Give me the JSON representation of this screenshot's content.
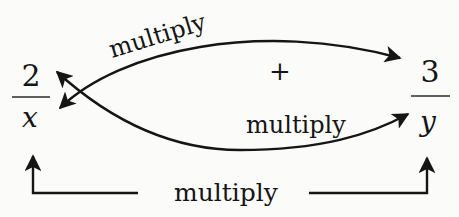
{
  "diagram": {
    "left_fraction": {
      "numerator": "2",
      "denominator": "x"
    },
    "right_fraction": {
      "numerator": "3",
      "denominator": "y"
    },
    "operator": "+",
    "labels": {
      "top_curve": "multiply",
      "lower_curve": "multiply",
      "bottom_connector": "multiply"
    },
    "colors": {
      "ink": "#151515",
      "background": "#fbfbfa"
    }
  }
}
